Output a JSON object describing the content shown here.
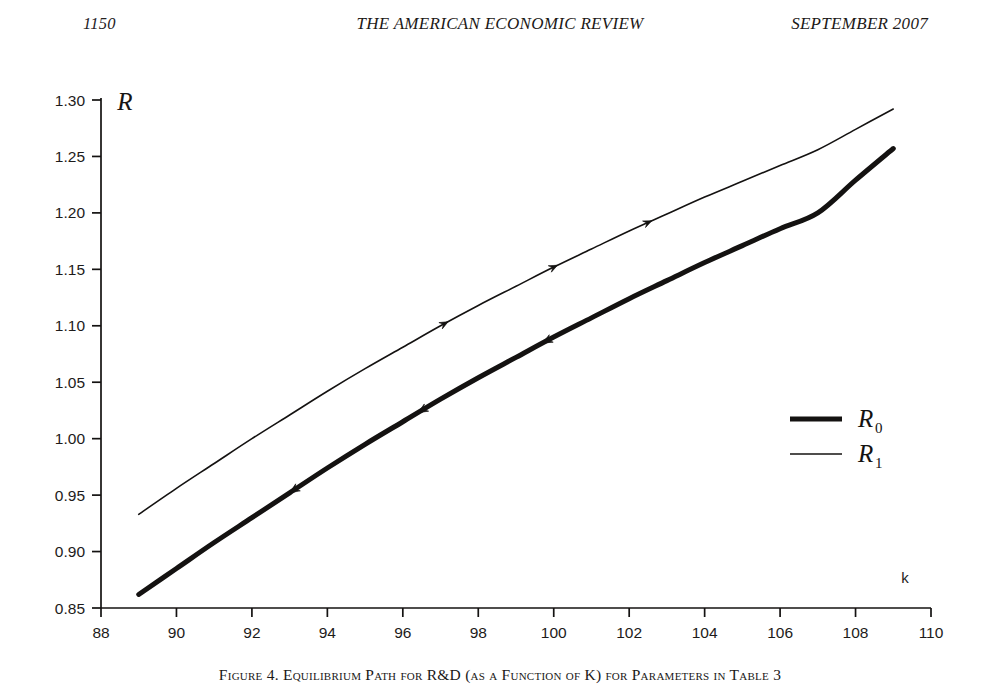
{
  "running_head": {
    "page_number": "1150",
    "journal_title": "THE AMERICAN ECONOMIC REVIEW",
    "issue_date": "SEPTEMBER 2007"
  },
  "figure": {
    "caption": "Figure 4. Equilibrium Path for R&D (as a Function of K) for Parameters in Table 3",
    "y_axis_name": "R",
    "x_axis_name": "k"
  },
  "legend": {
    "position": "inside-right",
    "entries": [
      {
        "symbol": "R",
        "subscript": "0",
        "label": "R0",
        "style": "thick-line",
        "line_width": 5
      },
      {
        "symbol": "R",
        "subscript": "1",
        "label": "R1",
        "style": "thin-line",
        "line_width": 1.6
      }
    ]
  },
  "chart_data": {
    "type": "line",
    "title": "Figure 4. Equilibrium Path for R&D (as a Function of K) for Parameters in Table 3",
    "xlabel": "k",
    "ylabel": "R",
    "xlim": [
      88,
      110
    ],
    "ylim": [
      0.85,
      1.3
    ],
    "xticks": [
      88,
      90,
      92,
      94,
      96,
      98,
      100,
      102,
      104,
      106,
      108,
      110
    ],
    "xtick_labels": [
      "88",
      "90",
      "92",
      "94",
      "96",
      "98",
      "100",
      "102",
      "104",
      "106",
      "108",
      "110"
    ],
    "yticks": [
      0.85,
      0.9,
      0.95,
      1.0,
      1.05,
      1.1,
      1.15,
      1.2,
      1.25,
      1.3
    ],
    "ytick_labels": [
      "0.85",
      "0.90",
      "0.95",
      "1.00",
      "1.05",
      "1.10",
      "1.15",
      "1.20",
      "1.25",
      "1.30"
    ],
    "grid": false,
    "legend_position": "center-right",
    "line_color": "#141211",
    "series": [
      {
        "name": "R0",
        "style": "thick",
        "line_width": 5,
        "arrow_direction": "decreasing-k",
        "arrow_positions_x": [
          93.0,
          96.4,
          99.7
        ],
        "x": [
          89.0,
          90.0,
          91.0,
          92.0,
          93.0,
          94.0,
          95.0,
          96.0,
          97.0,
          98.0,
          99.0,
          100.0,
          101.0,
          102.0,
          103.0,
          104.0,
          105.0,
          106.0,
          107.0,
          108.0,
          109.0
        ],
        "y": [
          0.862,
          0.885,
          0.908,
          0.93,
          0.952,
          0.974,
          0.995,
          1.015,
          1.035,
          1.054,
          1.072,
          1.09,
          1.107,
          1.124,
          1.14,
          1.156,
          1.171,
          1.186,
          1.2,
          1.229,
          1.257
        ]
      },
      {
        "name": "R1",
        "style": "thin",
        "line_width": 1.6,
        "arrow_direction": "increasing-k",
        "arrow_positions_x": [
          97.2,
          100.1,
          102.6
        ],
        "x": [
          89.0,
          90.0,
          91.0,
          92.0,
          93.0,
          94.0,
          95.0,
          96.0,
          97.0,
          98.0,
          99.0,
          100.0,
          101.0,
          102.0,
          103.0,
          104.0,
          105.0,
          106.0,
          107.0,
          108.0,
          109.0
        ],
        "y": [
          0.933,
          0.956,
          0.978,
          1.0,
          1.021,
          1.042,
          1.062,
          1.081,
          1.1,
          1.118,
          1.135,
          1.152,
          1.168,
          1.184,
          1.199,
          1.214,
          1.228,
          1.242,
          1.256,
          1.274,
          1.292
        ]
      }
    ]
  }
}
